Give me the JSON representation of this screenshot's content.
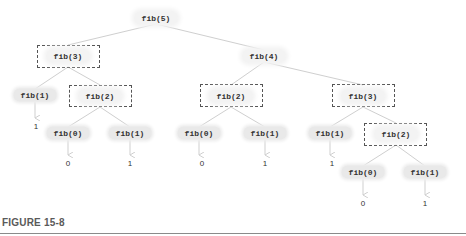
{
  "figure": {
    "caption": "FIGURE 15-8"
  },
  "tree": {
    "root": "fib(5)",
    "nodes": [
      {
        "id": "n5",
        "label": "fib(5)",
        "x": 156,
        "y": 18,
        "boxed": false
      },
      {
        "id": "n3a",
        "label": "fib(3)",
        "x": 68,
        "y": 56,
        "boxed": true,
        "box": [
          37,
          45,
          63,
          23
        ]
      },
      {
        "id": "n4",
        "label": "fib(4)",
        "x": 264,
        "y": 56,
        "boxed": false
      },
      {
        "id": "n1a",
        "label": "fib(1)",
        "x": 35,
        "y": 95,
        "boxed": false
      },
      {
        "id": "n2a",
        "label": "fib(2)",
        "x": 100,
        "y": 96,
        "boxed": true,
        "box": [
          69,
          85,
          63,
          22
        ]
      },
      {
        "id": "n0b",
        "label": "fib(0)",
        "x": 68,
        "y": 133,
        "boxed": false
      },
      {
        "id": "n1b",
        "label": "fib(1)",
        "x": 130,
        "y": 133,
        "boxed": false
      },
      {
        "id": "n2b",
        "label": "fib(2)",
        "x": 231,
        "y": 96,
        "boxed": true,
        "box": [
          200,
          84,
          63,
          23
        ]
      },
      {
        "id": "n0c",
        "label": "fib(0)",
        "x": 199,
        "y": 133,
        "boxed": false
      },
      {
        "id": "n1c",
        "label": "fib(1)",
        "x": 265,
        "y": 133,
        "boxed": false
      },
      {
        "id": "n3b",
        "label": "fib(3)",
        "x": 363,
        "y": 96,
        "boxed": true,
        "box": [
          332,
          84,
          63,
          23
        ]
      },
      {
        "id": "n1d",
        "label": "fib(1)",
        "x": 330,
        "y": 133,
        "boxed": false
      },
      {
        "id": "n2c",
        "label": "fib(2)",
        "x": 396,
        "y": 134,
        "boxed": true,
        "box": [
          364,
          123,
          63,
          23
        ]
      },
      {
        "id": "n0d",
        "label": "fib(0)",
        "x": 363,
        "y": 172,
        "boxed": false
      },
      {
        "id": "n1e",
        "label": "fib(1)",
        "x": 425,
        "y": 172,
        "boxed": false
      }
    ],
    "values": [
      {
        "of": "n1a",
        "label": "1",
        "x": 36,
        "y": 126
      },
      {
        "of": "n0b",
        "label": "0",
        "x": 68,
        "y": 163
      },
      {
        "of": "n1b",
        "label": "1",
        "x": 130,
        "y": 163
      },
      {
        "of": "n0c",
        "label": "0",
        "x": 202,
        "y": 163
      },
      {
        "of": "n1c",
        "label": "1",
        "x": 265,
        "y": 163
      },
      {
        "of": "n1d",
        "label": "1",
        "x": 332,
        "y": 163
      },
      {
        "of": "n0d",
        "label": "0",
        "x": 363,
        "y": 203
      },
      {
        "of": "n1e",
        "label": "1",
        "x": 425,
        "y": 203
      }
    ],
    "edges": [
      [
        "n5",
        "n3a"
      ],
      [
        "n5",
        "n4"
      ],
      [
        "n3a",
        "n1a"
      ],
      [
        "n3a",
        "n2a"
      ],
      [
        "n2a",
        "n0b"
      ],
      [
        "n2a",
        "n1b"
      ],
      [
        "n4",
        "n2b"
      ],
      [
        "n4",
        "n3b"
      ],
      [
        "n2b",
        "n0c"
      ],
      [
        "n2b",
        "n1c"
      ],
      [
        "n3b",
        "n1d"
      ],
      [
        "n3b",
        "n2c"
      ],
      [
        "n2c",
        "n0d"
      ],
      [
        "n2c",
        "n1e"
      ]
    ],
    "colors": {
      "edge": "#cfcfcf",
      "node_fill": "#e9e9e9",
      "box_border": "#555555",
      "text": "#333333",
      "caption": "#5a5a5a",
      "rule": "#8a8a8a"
    }
  }
}
